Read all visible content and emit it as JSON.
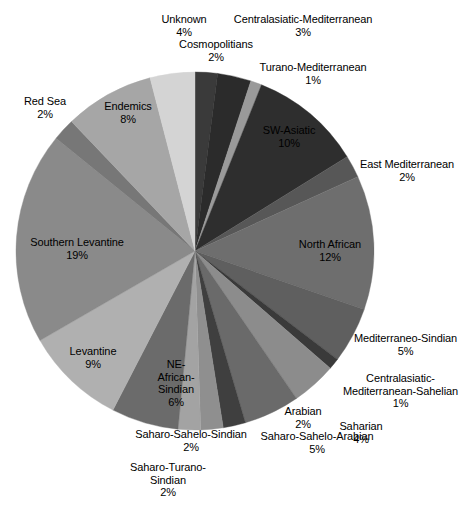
{
  "chart_data": {
    "type": "pie",
    "title": "",
    "subtitle": "",
    "xlabel": "",
    "ylabel": "",
    "legend_position": "none",
    "grid": false,
    "units": "percent",
    "total": 100,
    "start_angle_deg": 0,
    "direction": "clockwise",
    "categories": [
      "Cosmopolitians",
      "Centralasiatic-Mediterranean",
      "Turano-Mediterranean",
      "SW-Asiatic",
      "East Mediterranean",
      "North African",
      "Mediterraneo-Sindian",
      "Centralasiatic-Mediterranean-Sahelian",
      "Saharian",
      "Saharo-Sahelo-Arabian",
      "Arabian",
      "Saharo-Sahelo-Sindian",
      "Saharo-Turano-Sindian",
      "NE-African-Sindian",
      "Levantine",
      "Southern Levantine",
      "Red Sea",
      "Endemics",
      "Unknown"
    ],
    "values": [
      2,
      3,
      1,
      10,
      2,
      12,
      5,
      1,
      4,
      5,
      2,
      2,
      2,
      6,
      9,
      19,
      2,
      8,
      4
    ],
    "colors": [
      "#3a3a3a",
      "#2b2b2b",
      "#9a9a9a",
      "#2e2e2e",
      "#575757",
      "#6e6e6e",
      "#5f5f5f",
      "#3a3a3a",
      "#8c8c8c",
      "#6a6a6a",
      "#3f3f3f",
      "#8f8f8f",
      "#a3a3a3",
      "#6b6b6b",
      "#b0b0b0",
      "#8a8a8a",
      "#777777",
      "#a6a6a6",
      "#d4d4d4"
    ],
    "slices": [
      {
        "label": "Cosmopolitians",
        "value": 2,
        "display": "2%",
        "color": "#3a3a3a"
      },
      {
        "label": "Centralasiatic-Mediterranean",
        "value": 3,
        "display": "3%",
        "color": "#2b2b2b"
      },
      {
        "label": "Turano-Mediterranean",
        "value": 1,
        "display": "1%",
        "color": "#9a9a9a"
      },
      {
        "label": "SW-Asiatic",
        "value": 10,
        "display": "10%",
        "color": "#2e2e2e"
      },
      {
        "label": "East Mediterranean",
        "value": 2,
        "display": "2%",
        "color": "#575757"
      },
      {
        "label": "North African",
        "value": 12,
        "display": "12%",
        "color": "#6e6e6e"
      },
      {
        "label": "Mediterraneo-Sindian",
        "value": 5,
        "display": "5%",
        "color": "#5f5f5f"
      },
      {
        "label": "Centralasiatic-Mediterranean-Sahelian",
        "value": 1,
        "display": "1%",
        "color": "#3a3a3a"
      },
      {
        "label": "Saharian",
        "value": 4,
        "display": "4%",
        "color": "#8c8c8c"
      },
      {
        "label": "Saharo-Sahelo-Arabian",
        "value": 5,
        "display": "5%",
        "color": "#6a6a6a"
      },
      {
        "label": "Arabian",
        "value": 2,
        "display": "2%",
        "color": "#3f3f3f"
      },
      {
        "label": "Saharo-Sahelo-Sindian",
        "value": 2,
        "display": "2%",
        "color": "#8f8f8f"
      },
      {
        "label": "Saharo-Turano-Sindian",
        "value": 2,
        "display": "2%",
        "color": "#a3a3a3"
      },
      {
        "label": "NE-African-Sindian",
        "value": 6,
        "display": "6%",
        "color": "#6b6b6b"
      },
      {
        "label": "Levantine",
        "value": 9,
        "display": "9%",
        "color": "#b0b0b0"
      },
      {
        "label": "Southern Levantine",
        "value": 19,
        "display": "19%",
        "color": "#8a8a8a"
      },
      {
        "label": "Red Sea",
        "value": 2,
        "display": "2%",
        "color": "#777777"
      },
      {
        "label": "Endemics",
        "value": 8,
        "display": "8%",
        "color": "#a6a6a6"
      },
      {
        "label": "Unknown",
        "value": 4,
        "display": "4%",
        "color": "#d4d4d4"
      }
    ]
  },
  "labels": [
    {
      "name": "Unknown",
      "value": "4%",
      "x": 148,
      "y": 13,
      "w": 72,
      "on_slice": false
    },
    {
      "name": "Centralasiatic-Mediterranean",
      "value": "3%",
      "x": 210,
      "y": 13,
      "w": 186,
      "on_slice": false
    },
    {
      "name": "Cosmopolitians",
      "value": "2%",
      "x": 165,
      "y": 38,
      "w": 102,
      "on_slice": false
    },
    {
      "name": "Turano-Mediterranean",
      "value": "1%",
      "x": 241,
      "y": 61,
      "w": 144,
      "on_slice": false
    },
    {
      "name": "Red Sea",
      "value": "2%",
      "x": 14,
      "y": 95,
      "w": 62,
      "on_slice": false
    },
    {
      "name": "Endemics",
      "value": "8%",
      "x": 92,
      "y": 100,
      "w": 72,
      "on_slice": true
    },
    {
      "name": "SW-Asiatic",
      "value": "10%",
      "x": 253,
      "y": 124,
      "w": 72,
      "on_slice": true
    },
    {
      "name": "East Mediterranean",
      "value": "2%",
      "x": 344,
      "y": 158,
      "w": 126,
      "on_slice": false
    },
    {
      "name": "Southern Levantine",
      "value": "19%",
      "x": 14,
      "y": 236,
      "w": 126,
      "on_slice": true
    },
    {
      "name": "North African",
      "value": "12%",
      "x": 284,
      "y": 238,
      "w": 92,
      "on_slice": true
    },
    {
      "name": "Mediterraneo-Sindian",
      "value": "5%",
      "x": 341,
      "y": 332,
      "w": 129,
      "on_slice": false
    },
    {
      "name": "Levantine",
      "value": "9%",
      "x": 57,
      "y": 345,
      "w": 72,
      "on_slice": true
    },
    {
      "name": "Centralasiatic-\nMediterranean-Sahelian",
      "value": "1%",
      "x": 331,
      "y": 372,
      "w": 139,
      "on_slice": false
    },
    {
      "name": "NE-\nAfrican-\nSindian",
      "value": "6%",
      "x": 145,
      "y": 358,
      "w": 62,
      "on_slice": true
    },
    {
      "name": "Arabian",
      "value": "2%",
      "x": 272,
      "y": 405,
      "w": 62,
      "on_slice": false
    },
    {
      "name": "Saharian",
      "value": "4%",
      "x": 330,
      "y": 420,
      "w": 62,
      "on_slice": false
    },
    {
      "name": "Saharo-Sahelo-Sindian",
      "value": "2%",
      "x": 120,
      "y": 428,
      "w": 142,
      "on_slice": false
    },
    {
      "name": "Saharo-Sahelo-Arabian",
      "value": "5%",
      "x": 244,
      "y": 430,
      "w": 146,
      "on_slice": false
    },
    {
      "name": "Saharo-Turano-\nSindian",
      "value": "2%",
      "x": 119,
      "y": 461,
      "w": 98,
      "on_slice": false
    }
  ],
  "geometry": {
    "cx": 195,
    "cy": 251,
    "r": 179
  }
}
